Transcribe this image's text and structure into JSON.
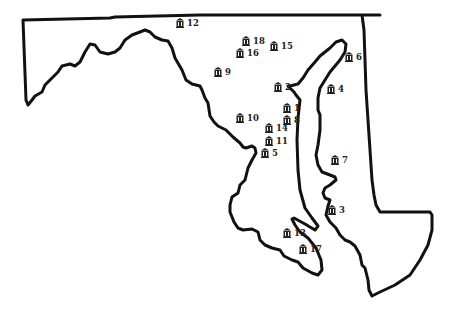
{
  "map": {
    "markers": [
      {
        "id": "1",
        "label": "1",
        "x": 283,
        "y": 108
      },
      {
        "id": "2",
        "label": "2",
        "x": 274,
        "y": 87
      },
      {
        "id": "3",
        "label": "3",
        "x": 328,
        "y": 210
      },
      {
        "id": "4",
        "label": "4",
        "x": 327,
        "y": 89
      },
      {
        "id": "5",
        "label": "5",
        "x": 261,
        "y": 153
      },
      {
        "id": "6",
        "label": "6",
        "x": 345,
        "y": 57
      },
      {
        "id": "7",
        "label": "7",
        "x": 331,
        "y": 160
      },
      {
        "id": "8",
        "label": "8",
        "x": 283,
        "y": 120
      },
      {
        "id": "9",
        "label": "9",
        "x": 214,
        "y": 72
      },
      {
        "id": "10",
        "label": "10",
        "x": 236,
        "y": 118
      },
      {
        "id": "11",
        "label": "11",
        "x": 265,
        "y": 141
      },
      {
        "id": "12",
        "label": "12",
        "x": 176,
        "y": 23
      },
      {
        "id": "13",
        "label": "13",
        "x": 283,
        "y": 233
      },
      {
        "id": "14",
        "label": "14",
        "x": 265,
        "y": 128
      },
      {
        "id": "15",
        "label": "15",
        "x": 270,
        "y": 46
      },
      {
        "id": "16",
        "label": "16",
        "x": 236,
        "y": 53
      },
      {
        "id": "17",
        "label": "17",
        "x": 299,
        "y": 249
      },
      {
        "id": "18",
        "label": "18",
        "x": 242,
        "y": 41
      }
    ],
    "marker_icon": "courthouse-icon",
    "outline_color": "#111111",
    "background": "#ffffff"
  }
}
